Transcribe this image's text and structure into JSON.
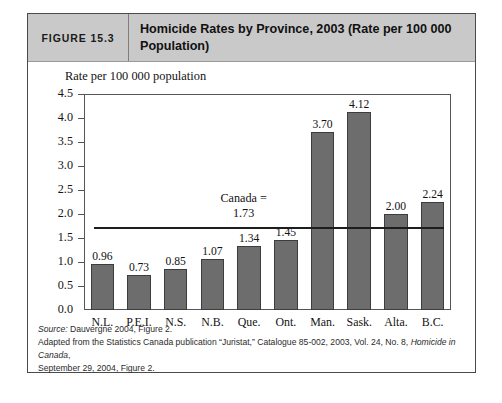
{
  "header": {
    "figure_number": "FIGURE 15.3",
    "title": "Homicide Rates by Province, 2003 (Rate per 100 000 Population)",
    "background_color": "#c9c9c9"
  },
  "chart_data": {
    "type": "bar",
    "title": "Homicide Rates by Province, 2003 (Rate per 100 000 Population)",
    "xlabel": "",
    "ylabel": "Rate per 100 000 population",
    "categories": [
      "N.L.",
      "P.E.I.",
      "N.S.",
      "N.B.",
      "Que.",
      "Ont.",
      "Man.",
      "Sask.",
      "Alta.",
      "B.C."
    ],
    "values": [
      0.96,
      0.73,
      0.85,
      1.07,
      1.34,
      1.45,
      3.7,
      4.12,
      2.0,
      2.24
    ],
    "value_labels": [
      "0.96",
      "0.73",
      "0.85",
      "1.07",
      "1.34",
      "1.45",
      "3.70",
      "4.12",
      "2.00",
      "2.24"
    ],
    "ylim": [
      0,
      4.5
    ],
    "ytick_labels": [
      "0.0",
      "0.5",
      "1.0",
      "1.5",
      "2.0",
      "2.5",
      "3.0",
      "3.5",
      "4.0",
      "4.5"
    ],
    "ytick_values": [
      0,
      0.5,
      1,
      1.5,
      2,
      2.5,
      3,
      3.5,
      4,
      4.5
    ],
    "grid": false,
    "legend": null,
    "bar_color": "#6d6d6d",
    "bar_edge_color": "#3d3d3d",
    "annotations": [
      {
        "name": "canada-reference-line",
        "label_line1": "Canada =",
        "label_line2": "1.73",
        "value": 1.73,
        "line_color": "#1d1d1d"
      }
    ]
  },
  "source": {
    "label": "Source:",
    "line1_rest": " Dauvergne 2004, Figure 2.",
    "line2_part1": "Adapted from the Statistics Canada publication “Juristat,” Catalogue 85-002, 2003, Vol. 24, No. 8, ",
    "line2_italic": "Homicide in Canada",
    "line2_part2": ",",
    "line3": "September 29, 2004, Figure 2."
  }
}
